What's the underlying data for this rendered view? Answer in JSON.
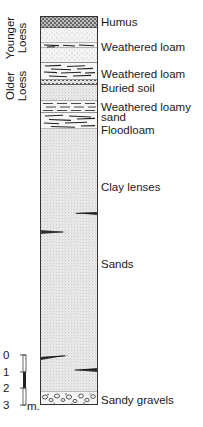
{
  "diagram": {
    "type": "stratigraphic-column",
    "groups": [
      {
        "id": "younger-loess",
        "label_line1": "Younger",
        "label_line2": "Loess"
      },
      {
        "id": "older-loess",
        "label_line1": "Older",
        "label_line2": "Loess"
      }
    ],
    "layers": [
      {
        "id": "humus",
        "label": "Humus",
        "pattern": "crosshatch",
        "top": 0,
        "height": 11
      },
      {
        "id": "younger-loess-upper",
        "label": "",
        "pattern": "fine-dots",
        "top": 11,
        "height": 15
      },
      {
        "id": "weathered-loam-1",
        "label": "Weathered loam",
        "pattern": "dashes",
        "top": 26,
        "height": 5
      },
      {
        "id": "younger-loess-lower",
        "label": "",
        "pattern": "fine-dots",
        "top": 31,
        "height": 15
      },
      {
        "id": "weathered-loam-2",
        "label": "Weathered loam",
        "pattern": "dashes",
        "top": 46,
        "height": 17
      },
      {
        "id": "buried-soil",
        "label": "Buried soil",
        "pattern": "chevrons",
        "top": 63,
        "height": 5
      },
      {
        "id": "older-loess-body",
        "label": "",
        "pattern": "fine-dots",
        "top": 68,
        "height": 16
      },
      {
        "id": "weathered-loamy-sand",
        "label": "Weathered loamy sand",
        "pattern": "dashes-dots",
        "top": 84,
        "height": 12
      },
      {
        "id": "floodloam",
        "label": "Floodloam",
        "pattern": "long-dashes",
        "top": 96,
        "height": 16
      },
      {
        "id": "sands",
        "label": "Sands",
        "pattern": "dense-dots",
        "top": 112,
        "height": 263
      },
      {
        "id": "sandy-gravels",
        "label": "Sandy gravels",
        "pattern": "pebbles",
        "top": 375,
        "height": 14
      }
    ],
    "labels": {
      "humus": "Humus",
      "weathered_loam_1": "Weathered loam",
      "weathered_loam_2": "Weathered loam",
      "buried_soil": "Buried soil",
      "weathered_loamy_line1": "Weathered loamy",
      "weathered_loamy_line2": "sand",
      "floodloam": "Floodloam",
      "clay_lenses": "Clay lenses",
      "sands": "Sands",
      "sandy_gravels": "Sandy gravels"
    },
    "scale_bar": {
      "ticks": [
        "0",
        "1",
        "2",
        "3"
      ],
      "unit": "m."
    }
  }
}
